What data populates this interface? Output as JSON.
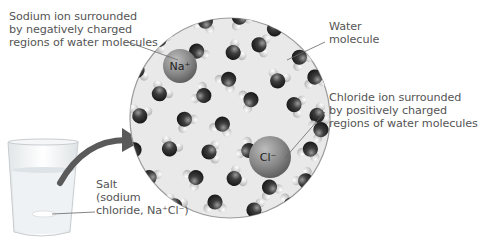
{
  "labels": {
    "sodium": [
      "Sodium ion surrounded",
      "by negatively charged",
      "regions of water molecules"
    ],
    "water": [
      "Water",
      "molecule"
    ],
    "chloride": [
      "Chloride ion surrounded",
      "by positively charged",
      "regions of water molecules"
    ],
    "salt": [
      "Salt",
      "(sodium",
      "chloride, Na⁺Cl⁻)"
    ]
  },
  "ions": {
    "sodium": "Na⁺",
    "chloride": "Cl⁻"
  },
  "colors": {
    "circle_fill": "#e9e9e9",
    "circle_stroke": "#999999",
    "oxygen": "#3a3a3a",
    "hydrogen": "#d8d8d8",
    "ion": "#8a8a8a",
    "arrow": "#555555",
    "text": "#555555"
  }
}
